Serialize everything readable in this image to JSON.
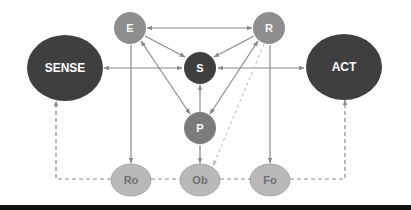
{
  "diagram": {
    "colors": {
      "dark_node": "#3f3f3f",
      "medium_node": "#7b7b7b",
      "gray_node": "#8e8e8e",
      "light_node": "#b9b9b9",
      "edge": "#8a8a8a",
      "dashed_edge": "#8a8a8a",
      "dotted_edge": "#c4c4c4",
      "light_text": "#6e6e6e",
      "bottom_bar": "#111111"
    },
    "nodes": {
      "sense": {
        "label": "SENSE"
      },
      "act": {
        "label": "ACT"
      },
      "e": {
        "label": "E"
      },
      "r": {
        "label": "R"
      },
      "s": {
        "label": "S"
      },
      "p": {
        "label": "P"
      },
      "ro": {
        "label": "Ro"
      },
      "ob": {
        "label": "Ob"
      },
      "fo": {
        "label": "Fo"
      }
    },
    "edges": [
      {
        "from": "SENSE",
        "to": "S",
        "style": "solid",
        "direction": "both"
      },
      {
        "from": "S",
        "to": "ACT",
        "style": "solid",
        "direction": "both"
      },
      {
        "from": "E",
        "to": "R",
        "style": "solid",
        "direction": "both"
      },
      {
        "from": "E",
        "to": "S",
        "style": "solid",
        "direction": "forward"
      },
      {
        "from": "R",
        "to": "S",
        "style": "solid",
        "direction": "forward"
      },
      {
        "from": "E",
        "to": "P",
        "style": "solid",
        "direction": "both"
      },
      {
        "from": "R",
        "to": "P",
        "style": "solid",
        "direction": "both"
      },
      {
        "from": "P",
        "to": "S",
        "style": "solid",
        "direction": "forward"
      },
      {
        "from": "E",
        "to": "Ro",
        "style": "solid",
        "direction": "forward"
      },
      {
        "from": "P",
        "to": "Ob",
        "style": "solid",
        "direction": "forward"
      },
      {
        "from": "R",
        "to": "Fo",
        "style": "solid",
        "direction": "forward"
      },
      {
        "from": "R",
        "to": "Ob",
        "style": "dotted-light",
        "direction": "forward"
      },
      {
        "from": "Ro",
        "to": "SENSE",
        "style": "dashed",
        "direction": "forward"
      },
      {
        "from": "Ro",
        "to": "Ob",
        "style": "dashed",
        "direction": "none"
      },
      {
        "from": "Ob",
        "to": "Fo",
        "style": "dashed",
        "direction": "none"
      },
      {
        "from": "Fo",
        "to": "ACT",
        "style": "dashed",
        "direction": "forward"
      }
    ]
  }
}
